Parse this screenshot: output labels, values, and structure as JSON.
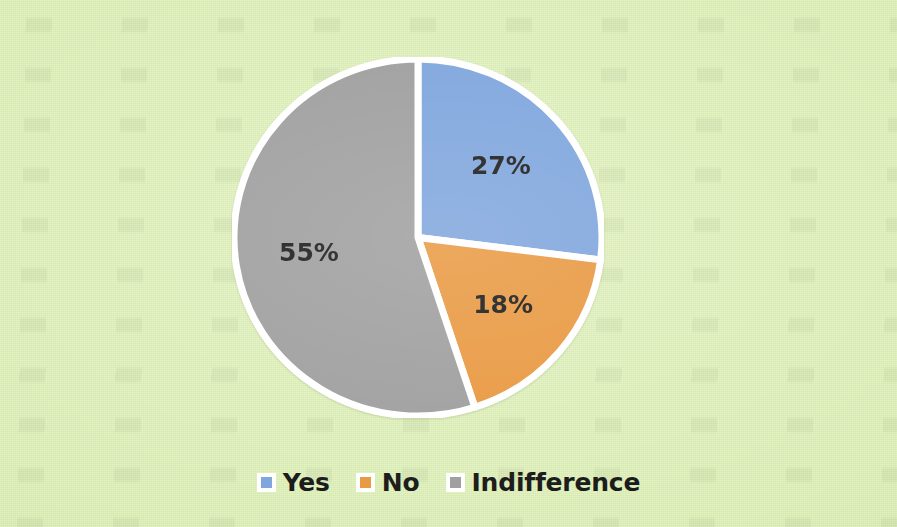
{
  "background": {
    "color": "#dcefb4",
    "description": "light-green scanned paper"
  },
  "chart_data": {
    "type": "pie",
    "title": "",
    "subtitle": "",
    "xlabel": "",
    "ylabel": "",
    "grid": false,
    "legend_position": "bottom",
    "start_angle_deg": 0,
    "direction": "clockwise",
    "slice_border_color": "#ffffff",
    "categories": [
      "Yes",
      "No",
      "Indifference"
    ],
    "values": [
      27,
      18,
      55
    ],
    "unit": "%",
    "data_labels": [
      "27%",
      "18%",
      "55%"
    ],
    "colors": [
      "#7ba3dc",
      "#e8963c",
      "#9c9c9c"
    ],
    "slices": [
      {
        "label": "Yes",
        "value": 27,
        "data_label": "27%",
        "color": "#7ba3dc",
        "start_deg": 0,
        "end_deg": 97.2
      },
      {
        "label": "No",
        "value": 18,
        "data_label": "18%",
        "color": "#e8963c",
        "start_deg": 97.2,
        "end_deg": 162
      },
      {
        "label": "Indifference",
        "value": 55,
        "data_label": "55%",
        "color": "#9c9c9c",
        "start_deg": 162,
        "end_deg": 360
      }
    ]
  },
  "legend": {
    "items": [
      {
        "label": "Yes",
        "color": "#7ba3dc",
        "swatch_name": "legend-swatch-yes"
      },
      {
        "label": "No",
        "color": "#e8963c",
        "swatch_name": "legend-swatch-no"
      },
      {
        "label": "Indifference",
        "color": "#9c9c9c",
        "swatch_name": "legend-swatch-indifference"
      }
    ]
  }
}
